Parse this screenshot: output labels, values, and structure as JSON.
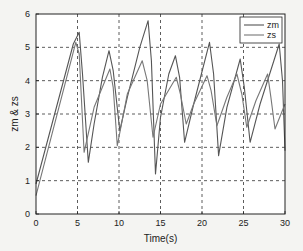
{
  "chart_data": {
    "type": "line",
    "title": "",
    "xlabel": "Time(s)",
    "ylabel": "zm & zs",
    "xlim": [
      0,
      30
    ],
    "ylim": [
      0,
      6
    ],
    "xticks": [
      0,
      5,
      10,
      15,
      20,
      25,
      30
    ],
    "yticks": [
      0,
      1,
      2,
      3,
      4,
      5,
      6
    ],
    "grid": true,
    "legend_position": "upper right",
    "series": [
      {
        "name": "zm",
        "x": [
          0,
          4.5,
          5.2,
          5.6,
          6.3,
          7.0,
          8.0,
          8.8,
          9.3,
          10.1,
          11.0,
          12.5,
          13.5,
          13.9,
          14.4,
          15.0,
          16.0,
          16.8,
          17.3,
          17.9,
          19.0,
          20.9,
          21.4,
          22.0,
          23.0,
          24.6,
          25.1,
          25.8,
          27.0,
          29.3,
          29.7,
          30
        ],
        "y": [
          0.9,
          5.1,
          5.45,
          4.2,
          1.55,
          2.7,
          4.1,
          4.9,
          4.3,
          2.5,
          3.5,
          5.0,
          5.8,
          4.6,
          1.2,
          2.9,
          4.2,
          4.75,
          4.1,
          2.15,
          3.3,
          5.15,
          4.2,
          1.75,
          3.2,
          4.65,
          3.8,
          2.15,
          3.3,
          5.1,
          4.0,
          1.9
        ]
      },
      {
        "name": "zs",
        "x": [
          0,
          4.8,
          5.2,
          5.8,
          7.0,
          8.9,
          9.3,
          9.8,
          11.0,
          12.8,
          13.4,
          14.1,
          15.0,
          16.9,
          17.4,
          18.1,
          19.0,
          20.6,
          21.1,
          21.8,
          23.0,
          24.2,
          24.8,
          25.4,
          26.5,
          27.9,
          28.3,
          28.8,
          30
        ],
        "y": [
          0.55,
          5.15,
          4.8,
          1.85,
          3.2,
          4.35,
          3.8,
          2.05,
          3.6,
          4.6,
          4.0,
          2.3,
          3.3,
          4.1,
          3.6,
          2.7,
          3.3,
          4.15,
          3.7,
          2.65,
          3.5,
          4.2,
          3.6,
          2.6,
          3.4,
          4.2,
          3.5,
          2.55,
          3.3
        ]
      }
    ]
  },
  "legend": {
    "items": [
      "zm",
      "zs"
    ]
  }
}
